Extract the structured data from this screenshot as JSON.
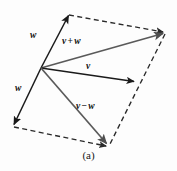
{
  "figure": {
    "caption": "(a)",
    "background_color": "#fdfdfd",
    "labels": {
      "w_upper": "w",
      "w_lower": "w",
      "v_plus_w_left": "v",
      "v_plus_w_op": "+",
      "v_plus_w_right": "w",
      "v": "v",
      "v_minus_w_left": "v",
      "v_minus_w_op": "−",
      "v_minus_w_right": "w"
    },
    "colors": {
      "solid_stroke": "#1a1a1a",
      "gray_stroke": "#5a5a5a",
      "dashed_stroke": "#2a2a2a"
    },
    "points": {
      "origin": [
        41,
        68
      ],
      "w_tip_upper": [
        68,
        14
      ],
      "v_plus_w_tip": [
        165,
        33
      ],
      "v_tip": [
        136,
        82
      ],
      "v_minus_w_tip": [
        108,
        146
      ],
      "w_tip_lower": [
        13,
        126
      ]
    }
  }
}
